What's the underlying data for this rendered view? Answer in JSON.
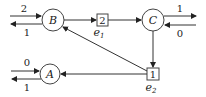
{
  "diagram": {
    "nodes": [
      {
        "id": "B",
        "label": "B",
        "shape": "circle"
      },
      {
        "id": "C",
        "label": "C",
        "shape": "circle"
      },
      {
        "id": "A",
        "label": "A",
        "shape": "circle"
      }
    ],
    "boxes": [
      {
        "id": "e1",
        "value": "2",
        "label": "e",
        "sub": "1"
      },
      {
        "id": "e2",
        "value": "1",
        "label": "e",
        "sub": "2"
      }
    ],
    "external_edges": {
      "B_in": "2",
      "B_out": "1",
      "C_out": "1",
      "C_in": "0",
      "A_in": "0",
      "A_out": "1"
    },
    "colors": {
      "stroke": "#333333",
      "background": "#ffffff"
    }
  }
}
